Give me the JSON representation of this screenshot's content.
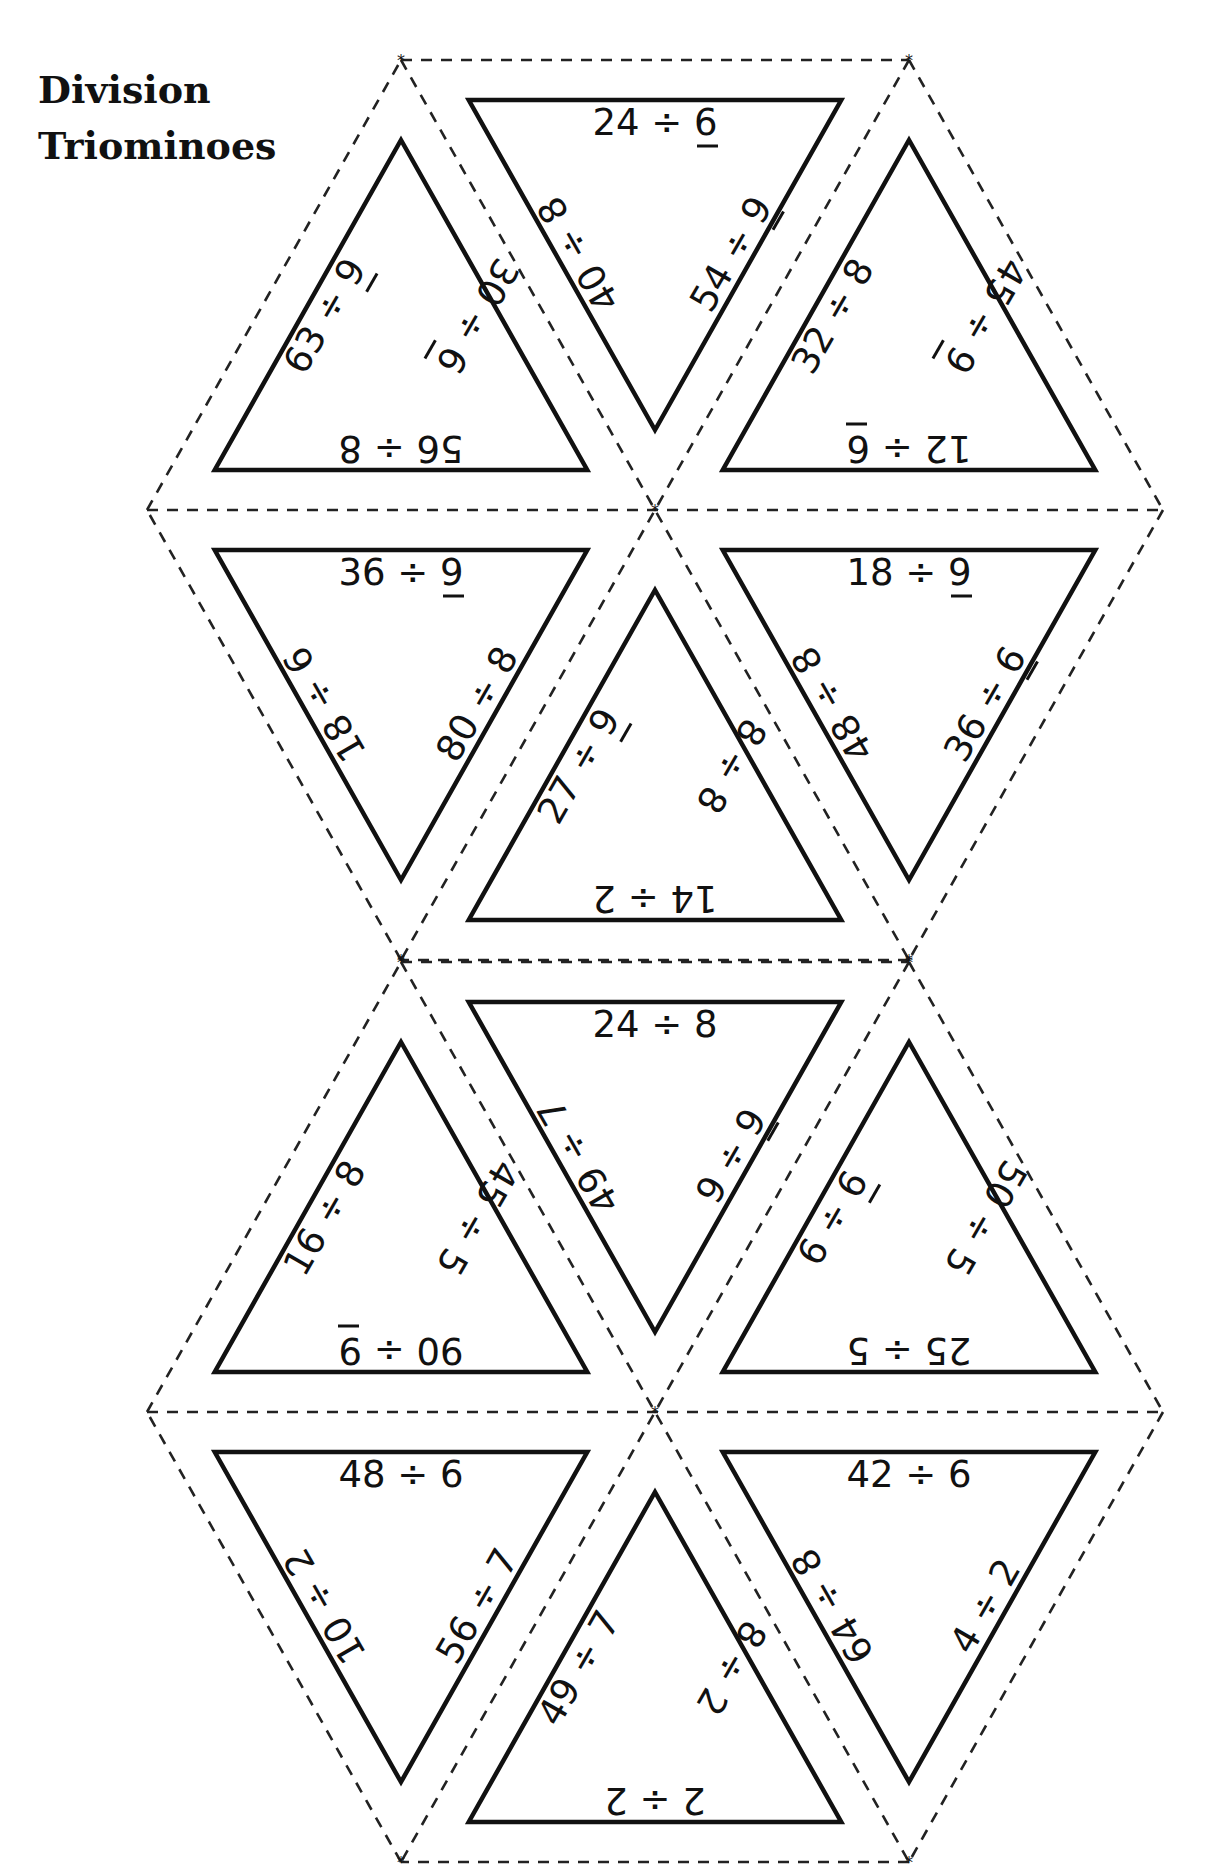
{
  "title": {
    "line1": "Division",
    "line2": "Triominoes"
  },
  "cut_marker": "*",
  "hexagons": [
    {
      "name": "hexagon-1",
      "triangles": [
        {
          "pos": "top-left-up",
          "bottom": "56 ÷ 8",
          "left": "63 ÷ 9",
          "right": "30 ÷ 6",
          "underline": [
            "left",
            "right"
          ]
        },
        {
          "pos": "top-middle-down",
          "top": "24 ÷ 6",
          "left": "40 ÷ 8",
          "right": "54 ÷ 9",
          "underline": [
            "top",
            "right"
          ]
        },
        {
          "pos": "top-right-up",
          "bottom": "12 ÷ 6",
          "left": "32 ÷ 8",
          "right": "45 ÷ 9",
          "underline": [
            "bottom",
            "right"
          ]
        },
        {
          "pos": "bottom-left-down",
          "top": "36 ÷ 9",
          "left": "18 ÷ 6",
          "right": "80 ÷ 8",
          "underline": [
            "top"
          ]
        },
        {
          "pos": "bottom-middle-up",
          "bottom": "14 ÷ 2",
          "left": "27 ÷ 9",
          "right": "8 ÷ 8",
          "underline": [
            "left"
          ]
        },
        {
          "pos": "bottom-right-down",
          "top": "18 ÷ 9",
          "left": "48 ÷ 8",
          "right": "36 ÷ 6",
          "underline": [
            "top",
            "right"
          ]
        }
      ]
    },
    {
      "name": "hexagon-2",
      "triangles": [
        {
          "pos": "top-left-up",
          "bottom": "90 ÷ 9",
          "left": "16 ÷ 8",
          "right": "45 ÷ 5",
          "underline": [
            "bottom"
          ]
        },
        {
          "pos": "top-middle-down",
          "top": "24 ÷ 8",
          "left": "49 ÷ 7",
          "right": "9 ÷ 9",
          "underline": [
            "right"
          ]
        },
        {
          "pos": "top-right-up",
          "bottom": "25 ÷ 5",
          "left": "6 ÷ 6",
          "right": "50 ÷ 5",
          "underline": [
            "left"
          ]
        },
        {
          "pos": "bottom-left-down",
          "top": "48 ÷ 6",
          "left": "10 ÷ 2",
          "right": "56 ÷ 7",
          "underline": []
        },
        {
          "pos": "bottom-middle-up",
          "bottom": "2 ÷ 2",
          "left": "49 ÷ 7",
          "right": "8 ÷ 2",
          "underline": []
        },
        {
          "pos": "bottom-right-down",
          "top": "42 ÷ 6",
          "left": "64 ÷ 8",
          "right": "4 ÷ 2",
          "underline": []
        }
      ]
    }
  ]
}
